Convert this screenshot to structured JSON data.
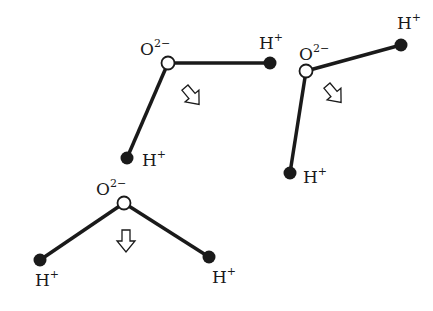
{
  "diagram": {
    "title": "",
    "molecules": [
      {
        "id": "molecule-1",
        "oxygen": {
          "label": "O",
          "charge": "2−",
          "x": 168,
          "y": 63
        },
        "hydrogens": [
          {
            "label": "H",
            "charge": "+",
            "x": 270,
            "y": 63
          },
          {
            "label": "H",
            "charge": "+",
            "x": 127,
            "y": 158
          }
        ],
        "dipole_arrow": {
          "direction": "down-right",
          "x": 192,
          "y": 96,
          "angle": 40
        }
      },
      {
        "id": "molecule-2",
        "oxygen": {
          "label": "O",
          "charge": "2−",
          "x": 306,
          "y": 71
        },
        "hydrogens": [
          {
            "label": "H",
            "charge": "+",
            "x": 401,
            "y": 45
          },
          {
            "label": "H",
            "charge": "+",
            "x": 290,
            "y": 173
          }
        ],
        "dipole_arrow": {
          "direction": "down-right",
          "x": 334,
          "y": 94,
          "angle": 40
        }
      },
      {
        "id": "molecule-3",
        "oxygen": {
          "label": "O",
          "charge": "2−",
          "x": 124,
          "y": 203
        },
        "hydrogens": [
          {
            "label": "H",
            "charge": "+",
            "x": 40,
            "y": 260
          },
          {
            "label": "H",
            "charge": "+",
            "x": 209,
            "y": 257
          }
        ],
        "dipole_arrow": {
          "direction": "down",
          "x": 126,
          "y": 240,
          "angle": 0
        }
      }
    ],
    "labels": {
      "m1_o": "O",
      "m1_o_charge": "2−",
      "m1_h1": "H",
      "m1_h1_charge": "+",
      "m1_h2": "H",
      "m1_h2_charge": "+",
      "m2_o": "O",
      "m2_o_charge": "2−",
      "m2_h1": "H",
      "m2_h1_charge": "+",
      "m2_h2": "H",
      "m2_h2_charge": "+",
      "m3_o": "O",
      "m3_o_charge": "2−",
      "m3_h1": "H",
      "m3_h1_charge": "+",
      "m3_h2": "H",
      "m3_h2_charge": "+"
    },
    "colors": {
      "bond": "#1a1a1a",
      "hydrogen": "#1a1a1a",
      "oxygen_fill": "#ffffff",
      "background": "#ffffff"
    }
  }
}
